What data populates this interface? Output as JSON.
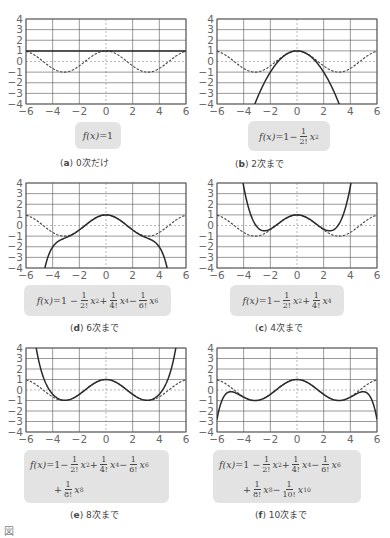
{
  "axis": {
    "xlim": [
      -6,
      6
    ],
    "ylim": [
      -4,
      4
    ],
    "xticks": [
      "−6",
      "−4",
      "−2",
      "0",
      "2",
      "4",
      "6"
    ],
    "yticks": [
      "4",
      "3",
      "2",
      "1",
      "0",
      "−1",
      "−2",
      "−3",
      "−4"
    ]
  },
  "colors": {
    "curve": "#2a2a2a",
    "cos_dashed": "#444444",
    "grid": "#555555",
    "box_bg": "#e3e3e3",
    "tick_text": "#666666"
  },
  "panels": [
    {
      "id": "a",
      "label": "a",
      "caption": "0次だけ",
      "order": 0,
      "formula_lines": [
        [
          {
            "t": "f(x)",
            "i": true
          },
          {
            "t": "=1"
          }
        ]
      ]
    },
    {
      "id": "b",
      "label": "b",
      "caption": "2次まで",
      "order": 2,
      "formula_lines": [
        [
          {
            "t": "f(x)",
            "i": true
          },
          {
            "t": "=1−"
          },
          {
            "f": [
              "1",
              "2!"
            ]
          },
          {
            "t": "x",
            "i": true,
            "s": "2"
          }
        ]
      ]
    },
    {
      "id": "d",
      "label": "d",
      "caption": "6次まで",
      "order": 6,
      "formula_lines": [
        [
          {
            "t": "f(x)",
            "i": true
          },
          {
            "t": "=1 −"
          },
          {
            "f": [
              "1",
              "2!"
            ]
          },
          {
            "t": "x",
            "i": true,
            "s": "2"
          },
          {
            "t": "+"
          },
          {
            "f": [
              "1",
              "4!"
            ]
          },
          {
            "t": "x",
            "i": true,
            "s": "4"
          },
          {
            "t": "−"
          },
          {
            "f": [
              "1",
              "6!"
            ]
          },
          {
            "t": "x",
            "i": true,
            "s": "6"
          }
        ]
      ]
    },
    {
      "id": "c",
      "label": "c",
      "caption": "4次まで",
      "order": 4,
      "formula_lines": [
        [
          {
            "t": "f(x)",
            "i": true
          },
          {
            "t": "=1−"
          },
          {
            "f": [
              "1",
              "2!"
            ]
          },
          {
            "t": "x",
            "i": true,
            "s": "2"
          },
          {
            "t": "+"
          },
          {
            "f": [
              "1",
              "4!"
            ]
          },
          {
            "t": "x",
            "i": true,
            "s": "4"
          }
        ]
      ]
    },
    {
      "id": "e",
      "label": "e",
      "caption": "8次まで",
      "order": 8,
      "formula_lines": [
        [
          {
            "t": "f(x)",
            "i": true
          },
          {
            "t": "=1−"
          },
          {
            "f": [
              "1",
              "2!"
            ]
          },
          {
            "t": "x",
            "i": true,
            "s": "2"
          },
          {
            "t": "+"
          },
          {
            "f": [
              "1",
              "4!"
            ]
          },
          {
            "t": "x",
            "i": true,
            "s": "4"
          },
          {
            "t": "−"
          },
          {
            "f": [
              "1",
              "6!"
            ]
          },
          {
            "t": "x",
            "i": true,
            "s": "6"
          }
        ],
        [
          {
            "t": "+"
          },
          {
            "f": [
              "1",
              "8!"
            ]
          },
          {
            "t": "x",
            "i": true,
            "s": "8"
          }
        ]
      ]
    },
    {
      "id": "f",
      "label": "f",
      "caption": "10次まで",
      "order": 10,
      "formula_lines": [
        [
          {
            "t": "f(x)",
            "i": true
          },
          {
            "t": "=1 −"
          },
          {
            "f": [
              "1",
              "2!"
            ]
          },
          {
            "t": "x",
            "i": true,
            "s": "2"
          },
          {
            "t": "+"
          },
          {
            "f": [
              "1",
              "4!"
            ]
          },
          {
            "t": "x",
            "i": true,
            "s": "4"
          },
          {
            "t": "−"
          },
          {
            "f": [
              "1",
              "6!"
            ]
          },
          {
            "t": "x",
            "i": true,
            "s": "6"
          }
        ],
        [
          {
            "t": "+"
          },
          {
            "f": [
              "1",
              "8!"
            ]
          },
          {
            "t": "x",
            "i": true,
            "s": "8"
          },
          {
            "t": "−"
          },
          {
            "f": [
              "1",
              "10!"
            ]
          },
          {
            "t": "x",
            "i": true,
            "s": "10"
          }
        ]
      ]
    }
  ],
  "figure_caption": "図",
  "chart_data": [
    {
      "type": "line",
      "title": "(a) 0次だけ",
      "xlabel": "",
      "ylabel": "",
      "xlim": [
        -6,
        6
      ],
      "ylim": [
        -4,
        4
      ],
      "grid": true,
      "series": [
        {
          "name": "f(x)=1",
          "style": "solid",
          "formula": "1"
        },
        {
          "name": "cos x",
          "style": "dashed",
          "formula": "cos(x)"
        }
      ]
    },
    {
      "type": "line",
      "title": "(b) 2次まで",
      "xlim": [
        -6,
        6
      ],
      "ylim": [
        -4,
        4
      ],
      "grid": true,
      "series": [
        {
          "name": "f(x)=1−x²/2!",
          "style": "solid"
        },
        {
          "name": "cos x",
          "style": "dashed"
        }
      ]
    },
    {
      "type": "line",
      "title": "(c) 4次まで",
      "xlim": [
        -6,
        6
      ],
      "ylim": [
        -4,
        4
      ],
      "grid": true,
      "series": [
        {
          "name": "f(x)=1−x²/2!+x⁴/4!",
          "style": "solid"
        },
        {
          "name": "cos x",
          "style": "dashed"
        }
      ]
    },
    {
      "type": "line",
      "title": "(d) 6次まで",
      "xlim": [
        -6,
        6
      ],
      "ylim": [
        -4,
        4
      ],
      "grid": true,
      "series": [
        {
          "name": "f(x)=1−x²/2!+x⁴/4!−x⁶/6!",
          "style": "solid"
        },
        {
          "name": "cos x",
          "style": "dashed"
        }
      ]
    },
    {
      "type": "line",
      "title": "(e) 8次まで",
      "xlim": [
        -6,
        6
      ],
      "ylim": [
        -4,
        4
      ],
      "grid": true,
      "series": [
        {
          "name": "f(x)=1−x²/2!+x⁴/4!−x⁶/6!+x⁸/8!",
          "style": "solid"
        },
        {
          "name": "cos x",
          "style": "dashed"
        }
      ]
    },
    {
      "type": "line",
      "title": "(f) 10次まで",
      "xlim": [
        -6,
        6
      ],
      "ylim": [
        -4,
        4
      ],
      "grid": true,
      "series": [
        {
          "name": "f(x)=1−x²/2!+x⁴/4!−x⁶/6!+x⁸/8!−x¹⁰/10!",
          "style": "solid"
        },
        {
          "name": "cos x",
          "style": "dashed"
        }
      ]
    }
  ]
}
